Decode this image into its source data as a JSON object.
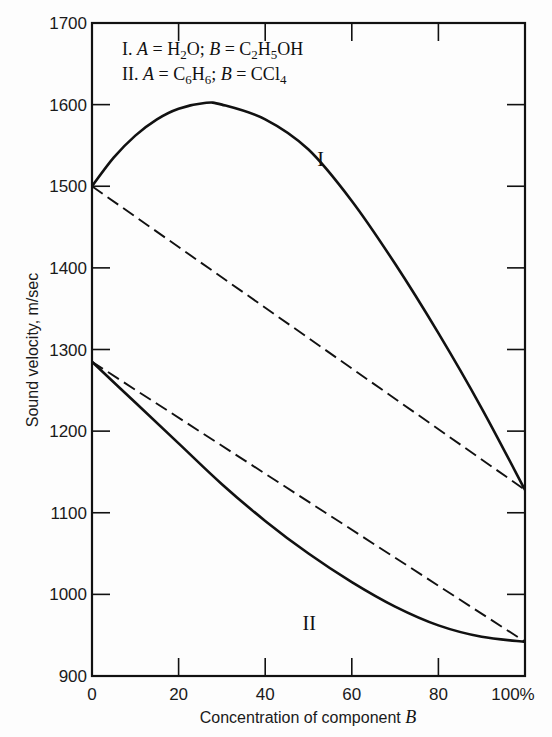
{
  "chart_data": {
    "type": "line",
    "title": "",
    "xlabel": "Concentration of component B",
    "ylabel": "Sound velocity, m/sec",
    "xlim": [
      0,
      100
    ],
    "ylim": [
      900,
      1700
    ],
    "x_ticks": [
      "0",
      "20",
      "40",
      "60",
      "80",
      "100%"
    ],
    "y_ticks": [
      "900",
      "1000",
      "1100",
      "1200",
      "1300",
      "1400",
      "1500",
      "1600",
      "1700"
    ],
    "grid": false,
    "legend_position": "top-left inside",
    "legend": [
      {
        "id": "I",
        "text": "I. A = H2O;  B = C2H5OH"
      },
      {
        "id": "II",
        "text": "II. A = C6H6;  B = CCl4"
      }
    ],
    "series": [
      {
        "name": "I (measured)",
        "style": "solid",
        "x": [
          0,
          5,
          10,
          15,
          20,
          26,
          30,
          40,
          50,
          60,
          70,
          80,
          90,
          100
        ],
        "y": [
          1500,
          1535,
          1562,
          1582,
          1595,
          1602,
          1600,
          1582,
          1545,
          1482,
          1405,
          1320,
          1228,
          1128
        ]
      },
      {
        "name": "I (linear)",
        "style": "dashed",
        "x": [
          0,
          100
        ],
        "y": [
          1500,
          1128
        ]
      },
      {
        "name": "II (measured)",
        "style": "solid",
        "x": [
          0,
          10,
          20,
          30,
          40,
          50,
          60,
          70,
          80,
          90,
          100
        ],
        "y": [
          1285,
          1235,
          1185,
          1135,
          1090,
          1050,
          1015,
          985,
          962,
          948,
          942
        ]
      },
      {
        "name": "II (linear)",
        "style": "dashed",
        "x": [
          0,
          100
        ],
        "y": [
          1285,
          942
        ]
      }
    ],
    "annotations": [
      {
        "text": "I",
        "x": 52,
        "y": 1555
      },
      {
        "text": "II",
        "x": 50,
        "y": 1020
      }
    ]
  },
  "labels": {
    "xlabel_text": "Concentration of component ",
    "xlabel_var": "B",
    "ylabel": "Sound velocity, m/sec",
    "curve_I": "I",
    "curve_II": "II"
  }
}
